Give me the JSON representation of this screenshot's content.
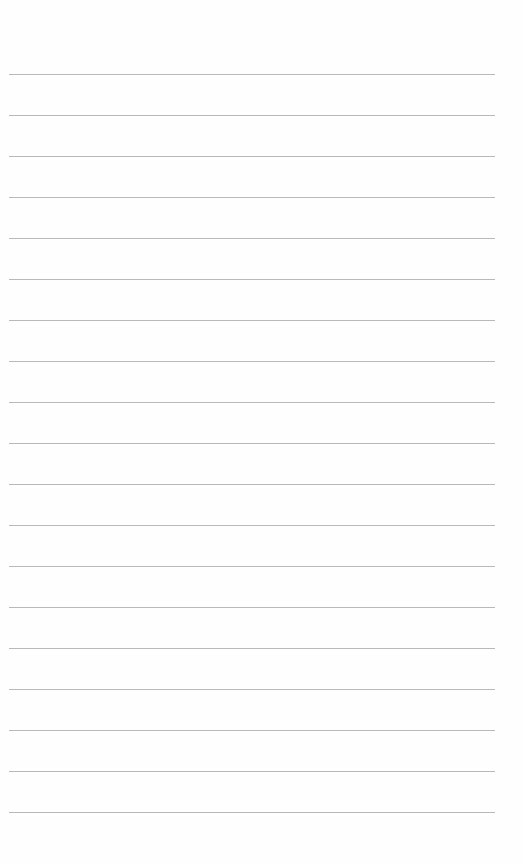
{
  "page": {
    "type": "lined-paper",
    "background": "#fefefe",
    "line_color": "#b9b9b9",
    "line_count": 19,
    "first_line_y": 74,
    "line_spacing": 41,
    "text_content": []
  }
}
